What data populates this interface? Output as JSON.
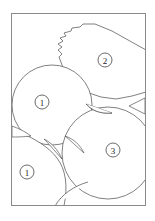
{
  "figure": {
    "background_color": "#ffffff",
    "line_color": "#555555",
    "frame_color": "#8a8a8a",
    "label_text_color": "#1a1a1a",
    "frame": {
      "x": 11,
      "y": 13,
      "width": 135,
      "height": 193
    },
    "regions": [
      {
        "id": "grain-serrated-polygon",
        "label": "2",
        "label_x": 105,
        "label_y": 60,
        "label_radius": 7,
        "shape": "polygon-serrated",
        "description": "Upper right polygonal grain with serrated left boundary"
      },
      {
        "id": "grain-circle-upper-left",
        "label": "1",
        "label_x": 42,
        "label_y": 102,
        "label_radius": 7,
        "shape": "circle",
        "cx": 52,
        "cy": 105,
        "r": 40,
        "description": "Upper left large circular grain"
      },
      {
        "id": "grain-circle-lower-right",
        "label": "3",
        "label_x": 113,
        "label_y": 150,
        "label_radius": 7,
        "shape": "circle",
        "cx": 108,
        "cy": 153,
        "r": 46,
        "description": "Lower right large circular grain"
      },
      {
        "id": "grain-matrix-lower-left",
        "label": "1",
        "label_x": 27,
        "label_y": 172,
        "label_radius": 7,
        "shape": "matrix-region",
        "description": "Lower left matrix region bounded by arcs"
      }
    ],
    "voids": [
      {
        "id": "void-left-edge",
        "description": "Curved triangular void at left edge mid-height"
      },
      {
        "id": "void-center",
        "description": "Curved triangular void between three grains at center"
      },
      {
        "id": "void-center-right",
        "description": "Curved triangular void right of the upper left circle"
      },
      {
        "id": "void-right-edge",
        "description": "Small triangular void at right edge"
      },
      {
        "id": "void-lower-center",
        "description": "Curved triangular void below center"
      }
    ]
  }
}
